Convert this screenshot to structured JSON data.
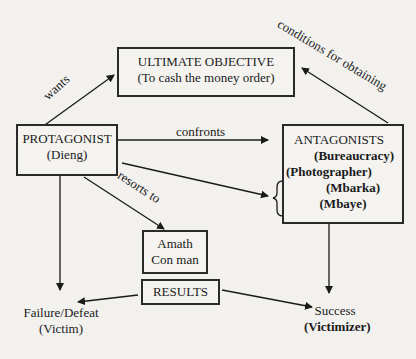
{
  "nodes": {
    "objective": {
      "title": "ULTIMATE OBJECTIVE",
      "subtitle": "(To cash the money order)"
    },
    "protagonist": {
      "title": "PROTAGONIST",
      "subtitle": "(Dieng)"
    },
    "antagonists": {
      "title": "ANTAGONISTS",
      "items": [
        "(Bureaucracy)",
        "(Photographer)",
        "(Mbarka)",
        "(Mbaye)"
      ]
    },
    "helper": {
      "name": "Amath",
      "role": "Con man"
    },
    "results": {
      "title": "RESULTS"
    },
    "failure": {
      "title": "Failure/Defeat",
      "subtitle": "(Victim)"
    },
    "success": {
      "title": "Success",
      "subtitle": "(Victimizer)"
    }
  },
  "edges": {
    "wants": "wants",
    "conditions": "conditions for obtaining",
    "confronts": "confronts",
    "resorts": "resorts to"
  },
  "colors": {
    "ink": "#1a1a1a",
    "paper": "#f2f1ee",
    "showthrough": "#b9b7b2"
  }
}
